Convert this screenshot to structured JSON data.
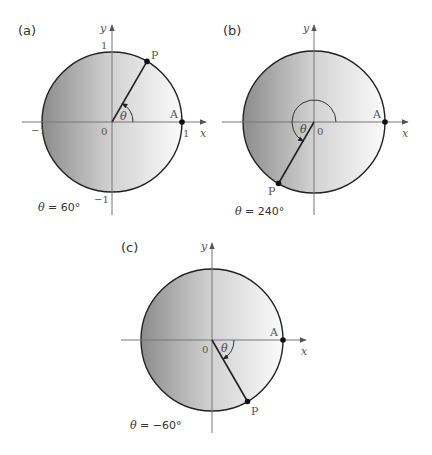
{
  "diagram": {
    "type": "unit-circle-angles",
    "colors": {
      "circle_stroke": "#222222",
      "axis": "#777777",
      "fill_dark": "#8c8c8c",
      "fill_light": "#fbfbfb"
    },
    "panels": [
      {
        "id": "a",
        "label": "(a)",
        "axis_x_label": "x",
        "axis_y_label": "y",
        "origin_label": "0",
        "tick_top": "1",
        "tick_bottom": "−1",
        "tick_left": "−1",
        "tick_right": "1",
        "point_a_label": "A",
        "point_p_label": "P",
        "angle_label": "θ",
        "angle_degrees": 60,
        "caption_theta": "θ",
        "caption_value": " = 60°"
      },
      {
        "id": "b",
        "label": "(b)",
        "axis_x_label": "x",
        "axis_y_label": "y",
        "origin_label": "0",
        "point_a_label": "A",
        "point_p_label": "P",
        "angle_label": "θ",
        "angle_degrees": 240,
        "caption_theta": "θ",
        "caption_value": " = 240°"
      },
      {
        "id": "c",
        "label": "(c)",
        "axis_x_label": "x",
        "axis_y_label": "y",
        "origin_label": "0",
        "point_a_label": "A",
        "point_p_label": "P",
        "angle_label": "θ",
        "angle_degrees": -60,
        "caption_theta": "θ",
        "caption_value": " = −60°"
      }
    ]
  }
}
